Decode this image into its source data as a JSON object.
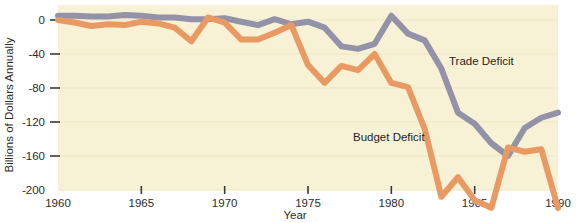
{
  "chart_data": {
    "type": "line",
    "title": "",
    "xlabel": "Year",
    "ylabel": "Billions of Dollars Annually",
    "xlim": [
      1960,
      1990
    ],
    "ylim": [
      -200,
      12
    ],
    "grid": true,
    "legend_position": "inline-annotations",
    "xticks": [
      "1960",
      "1965",
      "1970",
      "1975",
      "1980",
      "1985",
      "1990"
    ],
    "xtick_values": [
      1960,
      1965,
      1970,
      1975,
      1980,
      1985,
      1990
    ],
    "yticks": [
      "0",
      "-40",
      "-80",
      "-120",
      "-160",
      "-200"
    ],
    "ytick_values": [
      0,
      -40,
      -80,
      -120,
      -160,
      -200
    ],
    "x": [
      1960,
      1961,
      1962,
      1963,
      1964,
      1965,
      1966,
      1967,
      1968,
      1969,
      1970,
      1971,
      1972,
      1973,
      1974,
      1975,
      1976,
      1977,
      1978,
      1979,
      1980,
      1981,
      1982,
      1983,
      1984,
      1985,
      1986,
      1987,
      1988,
      1989,
      1990
    ],
    "series": [
      {
        "name": "Trade Deficit",
        "color": "#9492a8",
        "values": [
          5,
          5,
          4,
          4,
          6,
          5,
          3,
          3,
          1,
          1,
          2,
          -2,
          -6,
          1,
          -5,
          -2,
          -9,
          -31,
          -34,
          -28,
          5,
          -16,
          -24,
          -57,
          -109,
          -122,
          -145,
          -160,
          -127,
          -115,
          -109
        ]
      },
      {
        "name": "Budget Deficit",
        "color": "#e99a63",
        "values": [
          0,
          -3,
          -7,
          -5,
          -6,
          -2,
          -4,
          -9,
          -25,
          3,
          -3,
          -23,
          -23,
          -15,
          -6,
          -53,
          -74,
          -54,
          -59,
          -40,
          -74,
          -79,
          -128,
          -208,
          -185,
          -212,
          -221,
          -150,
          -155,
          -152,
          -221
        ]
      }
    ]
  },
  "axes": {
    "y_title": "Billions of Dollars Annually",
    "x_title": "Year"
  },
  "annotations": {
    "trade_deficit_label": "Trade Deficit",
    "budget_deficit_label": "Budget Deficit"
  },
  "colors": {
    "plot_background": "#f7f1d6",
    "page_background": "#ffffff",
    "grid_line": "#efe7c3",
    "trade_line": "#9492a8",
    "budget_line": "#e99a63",
    "text": "#2b2b2b",
    "tick_mark": "#3a3a3a"
  }
}
